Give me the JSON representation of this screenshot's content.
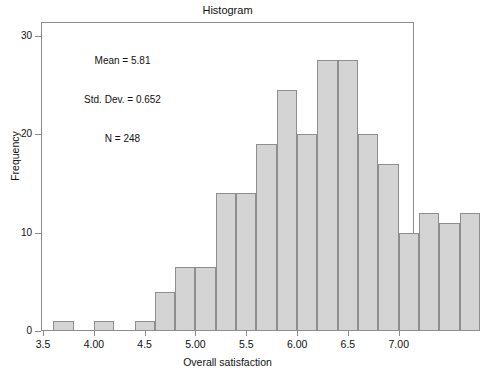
{
  "chart_data": {
    "type": "bar",
    "title": "Histogram",
    "xlabel": "Overall satisfaction",
    "ylabel": "Frequency",
    "xlim": [
      3.48,
      7.15
    ],
    "ylim": [
      0,
      31.4
    ],
    "grid": false,
    "legend": null,
    "bin_width": 0.2,
    "bar_color": "#d4d4d4",
    "bar_edge_color": "#8e8e8e",
    "annotations": [
      "Mean = 5.81",
      "Std. Dev. = 0.652",
      "N = 248"
    ],
    "stats": {
      "mean": "5.81",
      "std_dev": "0.652",
      "n": "248"
    },
    "xticks": [
      {
        "value": 3.5,
        "label": "3.5"
      },
      {
        "value": 4.0,
        "label": "4.00"
      },
      {
        "value": 4.5,
        "label": "4.5"
      },
      {
        "value": 5.0,
        "label": "5.00"
      },
      {
        "value": 5.5,
        "label": "5.5"
      },
      {
        "value": 6.0,
        "label": "6.00"
      },
      {
        "value": 6.5,
        "label": "6.5"
      },
      {
        "value": 7.0,
        "label": "7.00"
      }
    ],
    "yticks": [
      {
        "value": 0,
        "label": "0"
      },
      {
        "value": 10,
        "label": "10"
      },
      {
        "value": 20,
        "label": "20"
      },
      {
        "value": 30,
        "label": "30"
      }
    ],
    "bins": [
      {
        "x_left": 3.6,
        "x_right": 3.8,
        "center": 3.7,
        "value": 1
      },
      {
        "x_left": 3.8,
        "x_right": 4.0,
        "center": 3.9,
        "value": 0
      },
      {
        "x_left": 4.0,
        "x_right": 4.2,
        "center": 4.1,
        "value": 1
      },
      {
        "x_left": 4.2,
        "x_right": 4.4,
        "center": 4.3,
        "value": 0
      },
      {
        "x_left": 4.4,
        "x_right": 4.6,
        "center": 4.5,
        "value": 1
      },
      {
        "x_left": 4.6,
        "x_right": 4.8,
        "center": 4.7,
        "value": 4
      },
      {
        "x_left": 4.8,
        "x_right": 5.0,
        "center": 4.9,
        "value": 6.5
      },
      {
        "x_left": 5.0,
        "x_right": 5.2,
        "center": 5.1,
        "value": 6.5
      },
      {
        "x_left": 5.2,
        "x_right": 5.4,
        "center": 5.3,
        "value": 14
      },
      {
        "x_left": 5.4,
        "x_right": 5.6,
        "center": 5.5,
        "value": 14
      },
      {
        "x_left": 5.6,
        "x_right": 5.8,
        "center": 5.7,
        "value": 19
      },
      {
        "x_left": 5.8,
        "x_right": 6.0,
        "center": 5.9,
        "value": 24.5
      },
      {
        "x_left": 6.0,
        "x_right": 6.2,
        "center": 6.1,
        "value": 20
      },
      {
        "x_left": 6.2,
        "x_right": 6.4,
        "center": 6.3,
        "value": 27.5
      },
      {
        "x_left": 6.4,
        "x_right": 6.6,
        "center": 6.5,
        "value": 27.5
      },
      {
        "x_left": 6.6,
        "x_right": 6.8,
        "center": 6.7,
        "value": 20
      },
      {
        "x_left": 6.8,
        "x_right": 7.0,
        "center": 6.9,
        "value": 17
      },
      {
        "x_left": 7.0,
        "x_right": 7.2,
        "center": 7.1,
        "value": 10
      },
      {
        "x_left": 7.2,
        "x_right": 7.4,
        "center": 7.3,
        "value": 12
      },
      {
        "x_left": 7.4,
        "x_right": 7.6,
        "center": 7.5,
        "value": 11
      },
      {
        "x_left": 7.6,
        "x_right": 7.8,
        "center": 7.7,
        "value": 12
      }
    ],
    "categories": [
      "3.7",
      "3.9",
      "4.1",
      "4.3",
      "4.5",
      "4.7",
      "4.9",
      "5.1",
      "5.3",
      "5.5",
      "5.7",
      "5.9",
      "6.1",
      "6.3",
      "6.5",
      "6.7",
      "6.9",
      "7.1",
      "7.3",
      "7.5",
      "7.7"
    ],
    "values": [
      1,
      0,
      1,
      0,
      1,
      4,
      6.5,
      6.5,
      14,
      14,
      19,
      24.5,
      20,
      27.5,
      27.5,
      20,
      17,
      10,
      12,
      11,
      12
    ]
  }
}
